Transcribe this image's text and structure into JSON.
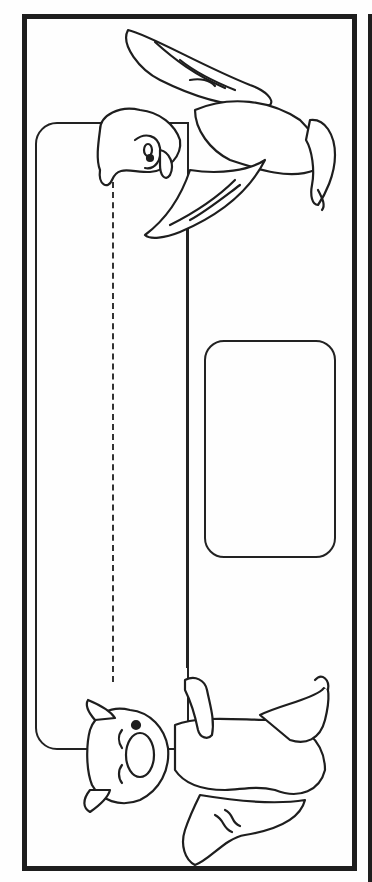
{
  "page": {
    "type": "coloring-page-bookmark",
    "orientation": "rotated-90",
    "colors": {
      "line": "#1e1e1e",
      "background": "#fefefe"
    },
    "elements": {
      "outer_border": "thick-rectangle-frame",
      "banner": "rounded-banner-with-dashed-guide-line",
      "name_box": "rounded-rectangle-blank",
      "top_character": "parrot-icon",
      "bottom_character": "fox-icon"
    }
  }
}
